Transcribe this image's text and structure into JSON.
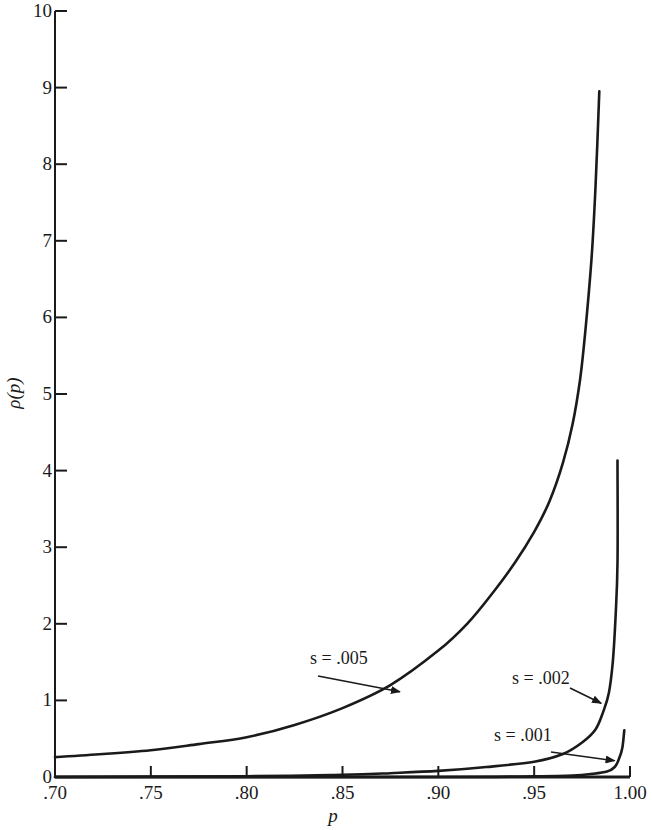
{
  "chart_data": {
    "type": "line",
    "title": "",
    "xlabel": "p",
    "ylabel": "ρ(p)",
    "xlim": [
      0.7,
      1.0
    ],
    "ylim": [
      0,
      10
    ],
    "grid": false,
    "legend": "none (curves annotated inline with arrows)",
    "x_ticks": [
      0.7,
      0.75,
      0.8,
      0.85,
      0.9,
      0.95,
      1.0
    ],
    "x_tick_labels": [
      ".70",
      ".75",
      ".80",
      ".85",
      ".90",
      ".95",
      "1.00"
    ],
    "y_ticks": [
      0,
      1,
      2,
      3,
      4,
      5,
      6,
      7,
      8,
      9,
      10
    ],
    "y_tick_labels": [
      "0",
      "1",
      "2",
      "3",
      "4",
      "5",
      "6",
      "7",
      "8",
      "9",
      "10"
    ],
    "series": [
      {
        "name": "s = .005",
        "annotation": "s = .005",
        "annotation_point": {
          "x": 0.881,
          "y": 1.1
        },
        "points": [
          [
            0.7,
            0.26
          ],
          [
            0.725,
            0.3
          ],
          [
            0.75,
            0.35
          ],
          [
            0.775,
            0.43
          ],
          [
            0.8,
            0.52
          ],
          [
            0.825,
            0.68
          ],
          [
            0.85,
            0.9
          ],
          [
            0.875,
            1.2
          ],
          [
            0.9,
            1.65
          ],
          [
            0.915,
            2.0
          ],
          [
            0.927,
            2.36
          ],
          [
            0.94,
            2.8
          ],
          [
            0.95,
            3.2
          ],
          [
            0.958,
            3.6
          ],
          [
            0.965,
            4.1
          ],
          [
            0.97,
            4.6
          ],
          [
            0.974,
            5.2
          ],
          [
            0.977,
            5.9
          ],
          [
            0.98,
            6.8
          ],
          [
            0.982,
            7.7
          ],
          [
            0.984,
            8.95
          ]
        ]
      },
      {
        "name": "s = .002",
        "annotation": "s = .002",
        "annotation_point": {
          "x": 0.986,
          "y": 0.95
        },
        "points": [
          [
            0.7,
            0.0
          ],
          [
            0.8,
            0.01
          ],
          [
            0.85,
            0.03
          ],
          [
            0.875,
            0.05
          ],
          [
            0.9,
            0.08
          ],
          [
            0.925,
            0.13
          ],
          [
            0.95,
            0.2
          ],
          [
            0.965,
            0.3
          ],
          [
            0.975,
            0.45
          ],
          [
            0.982,
            0.62
          ],
          [
            0.986,
            0.85
          ],
          [
            0.989,
            1.1
          ],
          [
            0.991,
            1.5
          ],
          [
            0.9925,
            2.1
          ],
          [
            0.9935,
            2.8
          ],
          [
            0.9935,
            4.13
          ]
        ]
      },
      {
        "name": "s = .001",
        "annotation": "s = .001",
        "annotation_point": {
          "x": 0.993,
          "y": 0.2
        },
        "points": [
          [
            0.7,
            0.0
          ],
          [
            0.9,
            0.0
          ],
          [
            0.95,
            0.01
          ],
          [
            0.97,
            0.02
          ],
          [
            0.98,
            0.04
          ],
          [
            0.988,
            0.07
          ],
          [
            0.992,
            0.13
          ],
          [
            0.994,
            0.22
          ],
          [
            0.996,
            0.38
          ],
          [
            0.997,
            0.61
          ]
        ]
      }
    ]
  }
}
